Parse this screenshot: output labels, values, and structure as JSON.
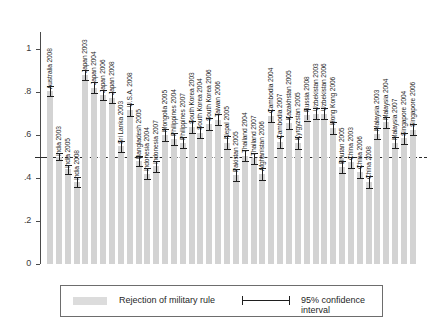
{
  "chart_data": {
    "type": "bar",
    "title": "",
    "subtitle": "",
    "xlabel": "",
    "ylabel": "",
    "ylim": [
      0,
      1.08
    ],
    "ytick_labels": [
      "0",
      ".2",
      ".4",
      ".6",
      ".8",
      "1"
    ],
    "ytick_values": [
      0,
      0.2,
      0.4,
      0.6,
      0.8,
      1
    ],
    "grid": false,
    "reference_line": 0.5,
    "legend_position": "bottom",
    "series_name": "Rejection of military rule",
    "error_label": "95% confidence interval",
    "categories": [
      "Australia 2008",
      "India 2003",
      "India 2005",
      "India 2008",
      "Japan 2003",
      "Japan 2004",
      "Japan 2006",
      "Japan 2008",
      "Sri Lanka 2003",
      "U.S.A. 2008",
      "Bangladesh 2005",
      "Indonesia 2004",
      "Indonesia 2007",
      "Mongolia 2005",
      "Philippines 2004",
      "Philippines 2007",
      "South Korea 2003",
      "South Korea 2004",
      "South Korea 2006",
      "Taiwan 2006",
      "Nepal 2005",
      "Pakistan 2005",
      "Thailand 2004",
      "Thailand 2007",
      "Afghanistan 2006",
      "Cambodia 2004",
      "Cambodia 2007",
      "Kazakhstan 2005",
      "Kyrgyzstan 2005",
      "Russia 2008",
      "Uzbekistan 2003",
      "Uzbekistan 2006",
      "Hong Kong 2006",
      "Bhutan 2005",
      "China 2003",
      "China 2006",
      "China 2008",
      "Malaysia 2003",
      "Malaysia 2004",
      "Malaysia 2007",
      "Singapore 2004",
      "Singapore 2006"
    ],
    "values": [
      0.805,
      0.5,
      0.44,
      0.383,
      0.88,
      0.82,
      0.787,
      0.775,
      0.547,
      0.718,
      0.48,
      0.42,
      0.455,
      0.6,
      0.58,
      0.565,
      0.64,
      0.612,
      0.65,
      0.672,
      0.565,
      0.415,
      0.505,
      0.492,
      0.42,
      0.69,
      0.57,
      0.658,
      0.563,
      0.695,
      0.7,
      0.7,
      0.632,
      0.452,
      0.473,
      0.428,
      0.383,
      0.607,
      0.66,
      0.565,
      0.585,
      0.625
    ],
    "ci_lower": [
      0.782,
      0.482,
      0.418,
      0.36,
      0.858,
      0.795,
      0.762,
      0.75,
      0.52,
      0.69,
      0.455,
      0.395,
      0.43,
      0.572,
      0.552,
      0.538,
      0.612,
      0.585,
      0.622,
      0.645,
      0.535,
      0.388,
      0.478,
      0.465,
      0.392,
      0.662,
      0.542,
      0.63,
      0.535,
      0.668,
      0.675,
      0.675,
      0.605,
      0.425,
      0.448,
      0.402,
      0.355,
      0.58,
      0.635,
      0.538,
      0.558,
      0.6
    ],
    "ci_upper": [
      0.828,
      0.518,
      0.462,
      0.406,
      0.902,
      0.845,
      0.812,
      0.8,
      0.574,
      0.746,
      0.505,
      0.445,
      0.48,
      0.628,
      0.608,
      0.592,
      0.668,
      0.639,
      0.678,
      0.699,
      0.595,
      0.442,
      0.532,
      0.519,
      0.448,
      0.718,
      0.598,
      0.686,
      0.591,
      0.722,
      0.725,
      0.725,
      0.659,
      0.479,
      0.498,
      0.454,
      0.411,
      0.634,
      0.685,
      0.592,
      0.612,
      0.65
    ]
  },
  "legend": {
    "bar_label": "Rejection of military rule",
    "ci_label": "95% confidence interval"
  }
}
